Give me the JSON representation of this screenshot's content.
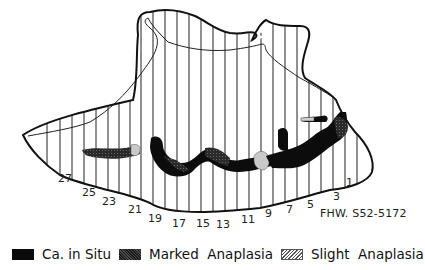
{
  "figure": {
    "specimen_id": "FHW. S52-5172",
    "section_numbers": [
      {
        "label": "1",
        "x": 346,
        "y": 177
      },
      {
        "label": "3",
        "x": 333,
        "y": 191
      },
      {
        "label": "5",
        "x": 307,
        "y": 199
      },
      {
        "label": "7",
        "x": 286,
        "y": 204
      },
      {
        "label": "9",
        "x": 265,
        "y": 208
      },
      {
        "label": "11",
        "x": 241,
        "y": 214
      },
      {
        "label": "13",
        "x": 216,
        "y": 219
      },
      {
        "label": "15",
        "x": 196,
        "y": 218
      },
      {
        "label": "17",
        "x": 172,
        "y": 218
      },
      {
        "label": "19",
        "x": 148,
        "y": 213
      },
      {
        "label": "21",
        "x": 128,
        "y": 204
      },
      {
        "label": "23",
        "x": 102,
        "y": 196
      },
      {
        "label": "25",
        "x": 82,
        "y": 187
      },
      {
        "label": "27",
        "x": 58,
        "y": 173
      }
    ],
    "colors": {
      "outline": "#111111",
      "ca_in_situ": "#0a0a0a",
      "marked_anaplasia": "#3a3a3a",
      "slight_anaplasia": "#bdbdbd"
    }
  },
  "legend": {
    "items": [
      {
        "key": "ca_in_situ",
        "label": "Ca. in Situ"
      },
      {
        "key": "marked_anaplasia",
        "label": "Marked  Anaplasia"
      },
      {
        "key": "slight_anaplasia",
        "label": "Slight  Anaplasia"
      }
    ]
  }
}
